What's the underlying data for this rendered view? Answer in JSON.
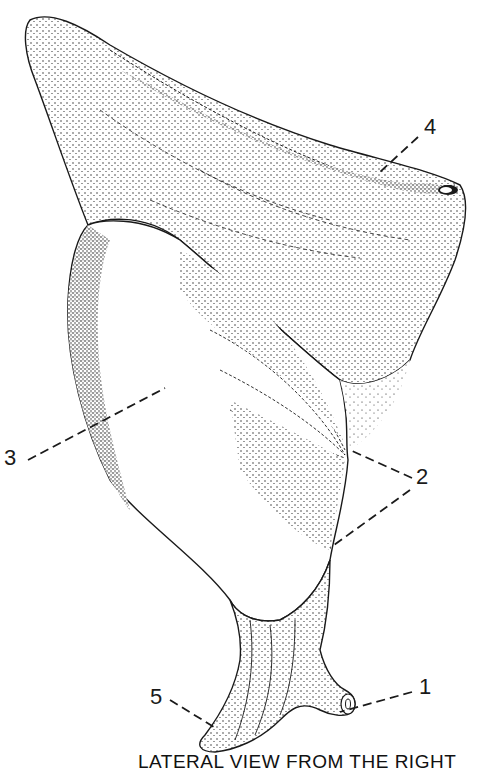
{
  "figure": {
    "type": "anatomical stippled illustration",
    "caption": "LATERAL VIEW FROM THE RIGHT",
    "ink_color": "#1a1a1a",
    "background_color": "#ffffff"
  },
  "callouts": [
    {
      "number": "1",
      "label_x": 419,
      "label_y": 680,
      "leader_from": [
        412,
        692
      ],
      "leader_to": [
        340,
        712
      ]
    },
    {
      "number": "2",
      "label_x": 418,
      "label_y": 466,
      "leader_from": [
        412,
        478
      ],
      "leader_to": [
        350,
        450
      ]
    },
    {
      "number": "2b",
      "label_x": 418,
      "label_y": 466,
      "leader_from": [
        410,
        494
      ],
      "leader_to": [
        330,
        548
      ]
    },
    {
      "number": "3",
      "label_x": 4,
      "label_y": 448,
      "leader_from": [
        28,
        460
      ],
      "leader_to": [
        165,
        388
      ]
    },
    {
      "number": "4",
      "label_x": 422,
      "label_y": 118,
      "leader_from": [
        418,
        137
      ],
      "leader_to": [
        378,
        172
      ]
    },
    {
      "number": "5",
      "label_x": 150,
      "label_y": 688,
      "leader_from": [
        170,
        700
      ],
      "leader_to": [
        214,
        727
      ]
    }
  ],
  "labels": {
    "one": "1",
    "two": "2",
    "three": "3",
    "four": "4",
    "five": "5"
  }
}
